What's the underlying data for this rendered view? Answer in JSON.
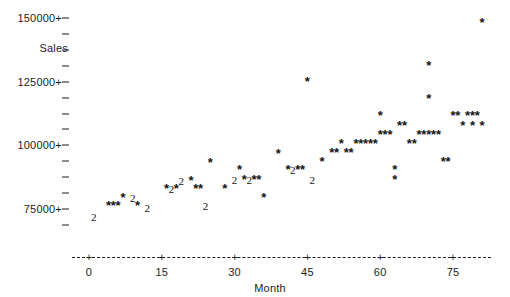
{
  "chart_data": {
    "type": "scatter",
    "title": "",
    "xlabel": "Month",
    "ylabel": "Sales",
    "xlim": [
      -3,
      82
    ],
    "ylim": [
      68750,
      153000
    ],
    "grid": false,
    "legend": null,
    "marker_glyph": "*",
    "overlap_glyph": "2",
    "overlap_note": "A digit marks that many coincident observations at one plotting position; '*' marks a single observation.",
    "xticks": [
      0,
      15,
      30,
      45,
      60,
      75
    ],
    "xtick_labels": [
      "0",
      "15",
      "30",
      "45",
      "60",
      "75"
    ],
    "yticks": [
      75000,
      100000,
      125000,
      150000
    ],
    "ytick_labels": [
      "75000+",
      "100000+",
      "125000+",
      "150000+"
    ],
    "y_minor_tick_count_between": 3,
    "points": [
      {
        "x": 1,
        "y": 72000,
        "n": 2
      },
      {
        "x": 4,
        "y": 76000,
        "n": 1
      },
      {
        "x": 5,
        "y": 76000,
        "n": 1
      },
      {
        "x": 6,
        "y": 76000,
        "n": 1
      },
      {
        "x": 7,
        "y": 79500,
        "n": 1
      },
      {
        "x": 9,
        "y": 79500,
        "n": 2
      },
      {
        "x": 10,
        "y": 76000,
        "n": 1
      },
      {
        "x": 12,
        "y": 75500,
        "n": 2
      },
      {
        "x": 16,
        "y": 83000,
        "n": 1
      },
      {
        "x": 17,
        "y": 83000,
        "n": 2
      },
      {
        "x": 18,
        "y": 83000,
        "n": 1
      },
      {
        "x": 19,
        "y": 86000,
        "n": 2
      },
      {
        "x": 21,
        "y": 86000,
        "n": 1
      },
      {
        "x": 22,
        "y": 83000,
        "n": 1
      },
      {
        "x": 23,
        "y": 83000,
        "n": 1
      },
      {
        "x": 24,
        "y": 76000,
        "n": 2
      },
      {
        "x": 25,
        "y": 93000,
        "n": 1
      },
      {
        "x": 28,
        "y": 83000,
        "n": 1
      },
      {
        "x": 30,
        "y": 86500,
        "n": 2
      },
      {
        "x": 31,
        "y": 90500,
        "n": 1
      },
      {
        "x": 32,
        "y": 86500,
        "n": 1
      },
      {
        "x": 33,
        "y": 86500,
        "n": 2
      },
      {
        "x": 34,
        "y": 86500,
        "n": 1
      },
      {
        "x": 35,
        "y": 86500,
        "n": 1
      },
      {
        "x": 36,
        "y": 79500,
        "n": 1
      },
      {
        "x": 39,
        "y": 96500,
        "n": 1
      },
      {
        "x": 41,
        "y": 90500,
        "n": 1
      },
      {
        "x": 42,
        "y": 90500,
        "n": 2
      },
      {
        "x": 43,
        "y": 90500,
        "n": 1
      },
      {
        "x": 44,
        "y": 90500,
        "n": 1
      },
      {
        "x": 45,
        "y": 125000,
        "n": 1
      },
      {
        "x": 46,
        "y": 86500,
        "n": 2
      },
      {
        "x": 48,
        "y": 93500,
        "n": 1
      },
      {
        "x": 50,
        "y": 97000,
        "n": 1
      },
      {
        "x": 51,
        "y": 97000,
        "n": 1
      },
      {
        "x": 52,
        "y": 100500,
        "n": 1
      },
      {
        "x": 53,
        "y": 97000,
        "n": 1
      },
      {
        "x": 54,
        "y": 97000,
        "n": 1
      },
      {
        "x": 55,
        "y": 100500,
        "n": 1
      },
      {
        "x": 56,
        "y": 100500,
        "n": 1
      },
      {
        "x": 57,
        "y": 100500,
        "n": 1
      },
      {
        "x": 58,
        "y": 100500,
        "n": 1
      },
      {
        "x": 59,
        "y": 100500,
        "n": 1
      },
      {
        "x": 60,
        "y": 104000,
        "n": 1
      },
      {
        "x": 61,
        "y": 104000,
        "n": 1
      },
      {
        "x": 62,
        "y": 104000,
        "n": 1
      },
      {
        "x": 60,
        "y": 111500,
        "n": 1
      },
      {
        "x": 63,
        "y": 90500,
        "n": 1
      },
      {
        "x": 63,
        "y": 86500,
        "n": 1
      },
      {
        "x": 64,
        "y": 107500,
        "n": 1
      },
      {
        "x": 65,
        "y": 107500,
        "n": 1
      },
      {
        "x": 66,
        "y": 100500,
        "n": 1
      },
      {
        "x": 67,
        "y": 100500,
        "n": 1
      },
      {
        "x": 68,
        "y": 104000,
        "n": 1
      },
      {
        "x": 69,
        "y": 104000,
        "n": 1
      },
      {
        "x": 70,
        "y": 104000,
        "n": 1
      },
      {
        "x": 71,
        "y": 104000,
        "n": 1
      },
      {
        "x": 72,
        "y": 104000,
        "n": 1
      },
      {
        "x": 73,
        "y": 93500,
        "n": 1
      },
      {
        "x": 74,
        "y": 93500,
        "n": 1
      },
      {
        "x": 70,
        "y": 118000,
        "n": 1
      },
      {
        "x": 75,
        "y": 111500,
        "n": 1
      },
      {
        "x": 76,
        "y": 111500,
        "n": 1
      },
      {
        "x": 77,
        "y": 107500,
        "n": 1
      },
      {
        "x": 78,
        "y": 111500,
        "n": 1
      },
      {
        "x": 79,
        "y": 111500,
        "n": 1
      },
      {
        "x": 80,
        "y": 111500,
        "n": 1
      },
      {
        "x": 79,
        "y": 107500,
        "n": 1
      },
      {
        "x": 81,
        "y": 107500,
        "n": 1
      },
      {
        "x": 70,
        "y": 131000,
        "n": 1
      },
      {
        "x": 81,
        "y": 148000,
        "n": 1
      }
    ]
  },
  "axes": {
    "y_title": "Sales",
    "x_title": "Month"
  }
}
